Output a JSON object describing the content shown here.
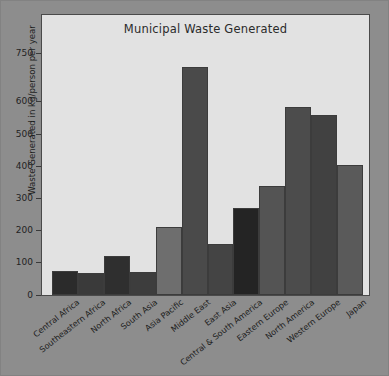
{
  "figure": {
    "background_color": "#8d8d8d",
    "plot_background_color": "#e2e2e2",
    "axis_color": "#3a3a3a"
  },
  "chart_data": {
    "type": "bar",
    "title": "Municipal Waste Generated",
    "xlabel": "",
    "ylabel": "Waste Generated in kg/person per year",
    "ylim": [
      0,
      780
    ],
    "yticks": [
      0,
      100,
      200,
      300,
      400,
      500,
      600,
      750
    ],
    "ytick_labels": [
      "0",
      "100",
      "200",
      "300",
      "400",
      "500",
      "600",
      "750"
    ],
    "grid": false,
    "legend": null,
    "categories": [
      "Central Africa",
      "Southeastern Africa",
      "North Africa",
      "South Asia",
      "Asia Pacific",
      "Middle East",
      "East Asia",
      "Central & South America",
      "Eastern Europe",
      "North America",
      "Western Europe",
      "Japan"
    ],
    "values": [
      75,
      68,
      120,
      72,
      212,
      710,
      158,
      270,
      340,
      585,
      560,
      405
    ],
    "bar_colors": [
      "#2b2b2b",
      "#3a3a3a",
      "#2f2f2f",
      "#3d3d3d",
      "#6e6e6e",
      "#4a4a4a",
      "#444444",
      "#242424",
      "#545454",
      "#4c4c4c",
      "#414141",
      "#5a5a5a"
    ]
  }
}
